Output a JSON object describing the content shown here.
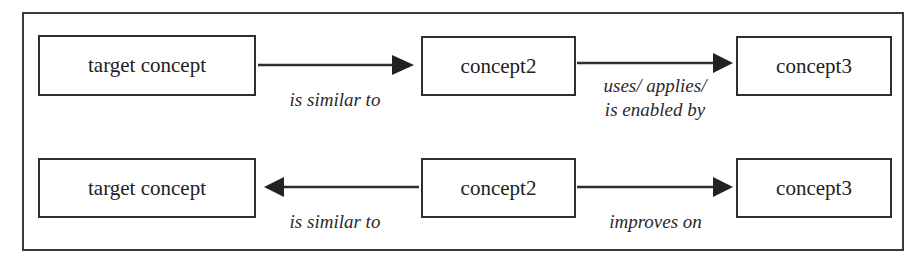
{
  "diagram": {
    "rows": [
      {
        "nodes": [
          {
            "id": "r1-n1",
            "label": "target concept"
          },
          {
            "id": "r1-n2",
            "label": "concept2"
          },
          {
            "id": "r1-n3",
            "label": "concept3"
          }
        ],
        "edges": [
          {
            "from": "target concept",
            "to": "concept2",
            "direction": "right",
            "label": "is similar to"
          },
          {
            "from": "concept2",
            "to": "concept3",
            "direction": "right",
            "label_line1": "uses/ applies/",
            "label_line2": "is enabled by"
          }
        ]
      },
      {
        "nodes": [
          {
            "id": "r2-n1",
            "label": "target concept"
          },
          {
            "id": "r2-n2",
            "label": "concept2"
          },
          {
            "id": "r2-n3",
            "label": "concept3"
          }
        ],
        "edges": [
          {
            "from": "concept2",
            "to": "target concept",
            "direction": "left",
            "label": "is similar to"
          },
          {
            "from": "concept2",
            "to": "concept3",
            "direction": "right",
            "label": "improves on"
          }
        ]
      }
    ],
    "colors": {
      "stroke": "#2e2e2e",
      "background": "#ffffff"
    }
  }
}
